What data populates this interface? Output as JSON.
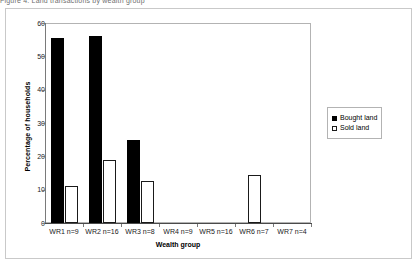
{
  "page": {
    "cut_off_caption": "Figure 4. Land transactions by wealth group"
  },
  "legend": {
    "position": "right",
    "entries": [
      {
        "label": "Bought land",
        "swatch": "filled-black-square"
      },
      {
        "label": "Sold land",
        "swatch": "open-white-square"
      }
    ]
  },
  "chart_data": {
    "type": "bar",
    "title": "",
    "xlabel": "Wealth group",
    "ylabel": "Percentage of households",
    "categories": [
      "WR1 n=9",
      "WR2 n=16",
      "WR3 n=8",
      "WR4 n=9",
      "WR5 n=16",
      "WR6 n=7",
      "WR7 n=4"
    ],
    "series": [
      {
        "name": "Bought land",
        "color": "#000000",
        "values": [
          55.5,
          56.2,
          25.0,
          0,
          0,
          0,
          0
        ]
      },
      {
        "name": "Sold land",
        "color": "#ffffff",
        "values": [
          11.1,
          18.8,
          12.5,
          0,
          0,
          14.3,
          0
        ]
      }
    ],
    "ylim": [
      0,
      60
    ],
    "yticks": [
      0,
      10,
      20,
      30,
      40,
      50,
      60
    ],
    "ytick_labels": [
      "0",
      "10",
      "20",
      "30",
      "40",
      "50",
      "60"
    ],
    "grid": false,
    "legend_position": "right"
  }
}
